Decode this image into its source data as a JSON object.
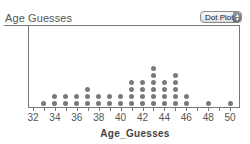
{
  "header": {
    "title": "Age Guesses",
    "plot_type_selector": {
      "selected": "Dot Plot",
      "icon": "up-down-arrows-icon"
    }
  },
  "chart_data": {
    "type": "scatter",
    "subtype": "dot_plot",
    "title": "Age Guesses",
    "xlabel": "Age_Guesses",
    "ylabel": "",
    "xlim": [
      32,
      50
    ],
    "x_ticks": [
      32,
      33,
      34,
      35,
      36,
      37,
      38,
      39,
      40,
      41,
      42,
      43,
      44,
      45,
      46,
      47,
      48,
      49,
      50
    ],
    "x_tick_labels": [
      "32",
      "34",
      "36",
      "38",
      "40",
      "42",
      "44",
      "46",
      "48",
      "50"
    ],
    "grid": false,
    "legend": null,
    "x": [
      33,
      34,
      35,
      36,
      37,
      38,
      39,
      40,
      41,
      42,
      43,
      44,
      45,
      46,
      48,
      50
    ],
    "counts": [
      1,
      2,
      2,
      2,
      3,
      2,
      2,
      2,
      4,
      4,
      6,
      4,
      5,
      2,
      1,
      1
    ],
    "dot_color": "#7a7a7a"
  }
}
